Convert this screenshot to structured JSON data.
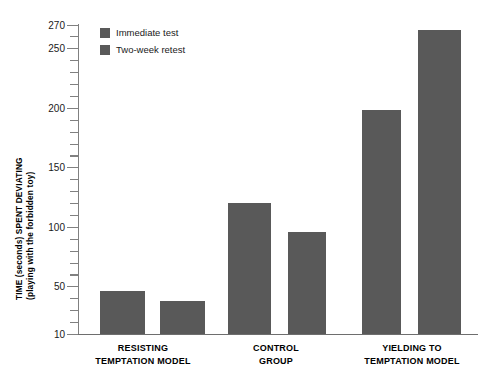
{
  "chart_data": {
    "type": "bar",
    "title": "",
    "subtitle": "",
    "xlabel": "",
    "ylabel": "TIME (seconds) SPENT DEVIATING (playing with the forbidden toy)",
    "ylabel_lines": [
      "TIME (seconds) SPENT DEVIATING",
      "(playing with the forbidden toy)"
    ],
    "ylim": [
      10,
      270
    ],
    "ytick_labels": [
      "270",
      "250",
      "200",
      "150",
      "100",
      "50",
      "10"
    ],
    "ytick_values": [
      270,
      250,
      200,
      150,
      100,
      50,
      10
    ],
    "minor_tick_step": 10,
    "grid": false,
    "legend_position": "top-left",
    "bar_color": "#595959",
    "axis_color": "#808080",
    "categories": [
      "RESISTING TEMPTATION MODEL",
      "CONTROL GROUP",
      "YIELDING TO TEMPTATION MODEL"
    ],
    "category_lines": [
      [
        "RESISTING",
        "TEMPTATION MODEL"
      ],
      [
        "CONTROL",
        "GROUP"
      ],
      [
        "YIELDING TO",
        "TEMPTATION MODEL"
      ]
    ],
    "series": [
      {
        "name": "Immediate test",
        "values": [
          46,
          120,
          198
        ]
      },
      {
        "name": "Two-week retest",
        "values": [
          38,
          96,
          265
        ]
      }
    ],
    "bars": [
      {
        "group": 0,
        "series": 0,
        "label": "Immediate test",
        "value": 46
      },
      {
        "group": 0,
        "series": 1,
        "label": "Two-week retest",
        "value": 38
      },
      {
        "group": 1,
        "series": 0,
        "label": "Immediate test",
        "value": 120
      },
      {
        "group": 1,
        "series": 1,
        "label": "Two-week retest",
        "value": 96
      },
      {
        "group": 2,
        "series": 0,
        "label": "Immediate test",
        "value": 198
      },
      {
        "group": 2,
        "series": 1,
        "label": "Two-week retest",
        "value": 265
      }
    ]
  },
  "legend": {
    "items": [
      {
        "label": "Immediate test",
        "color": "#595959"
      },
      {
        "label": "Two-week retest",
        "color": "#595959"
      }
    ]
  }
}
